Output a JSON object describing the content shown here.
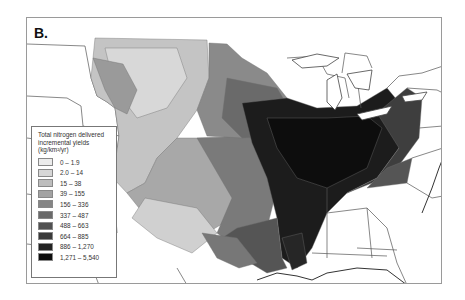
{
  "figure": {
    "panel_label": "B.",
    "map_subject": "Total nitrogen delivered incremental yields, Mississippi River basin, conterminous United States"
  },
  "legend": {
    "title_line1": "Total nitrogen delivered",
    "title_line2": "incremental yields",
    "title_line3": "(kg/km²/yr)",
    "classes": [
      {
        "label": "0 – 1.9",
        "color": "#ececec"
      },
      {
        "label": "2.0 – 14",
        "color": "#d6d6d6"
      },
      {
        "label": "15 – 38",
        "color": "#bdbdbd"
      },
      {
        "label": "39 – 155",
        "color": "#a2a2a2"
      },
      {
        "label": "156 – 336",
        "color": "#858585"
      },
      {
        "label": "337 – 487",
        "color": "#6a6a6a"
      },
      {
        "label": "488 – 663",
        "color": "#515151"
      },
      {
        "label": "664 – 885",
        "color": "#3a3a3a"
      },
      {
        "label": "886 – 1,270",
        "color": "#232323"
      },
      {
        "label": "1,271 – 5,540",
        "color": "#0d0d0d"
      }
    ]
  },
  "colors": {
    "background": "#ffffff",
    "frame": "#9a9a9a",
    "boundary": "#555555"
  }
}
